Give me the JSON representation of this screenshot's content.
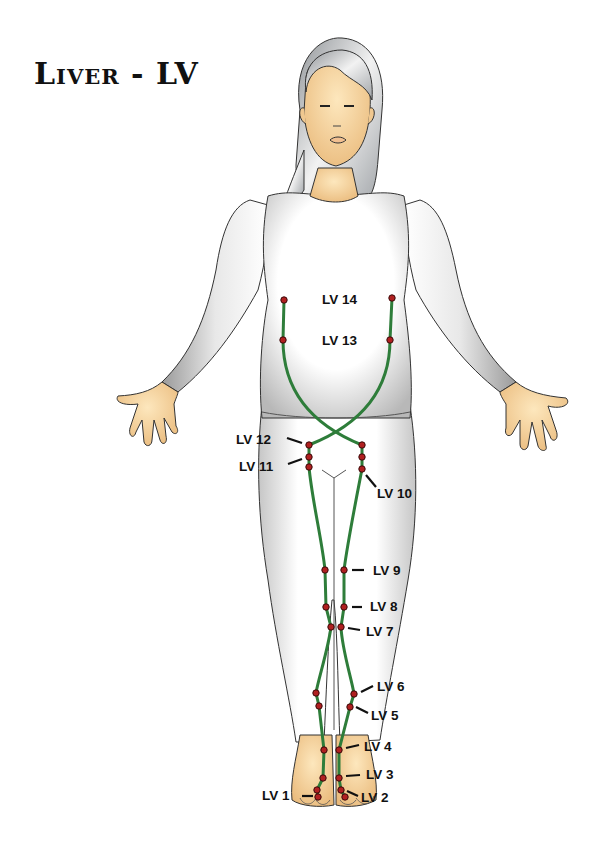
{
  "title": "Liver - LV",
  "colors": {
    "meridian": "#2e7d3a",
    "point_fill": "#b02020",
    "point_stroke": "#3a0a0a",
    "skin": "#f6d9a4",
    "hair": "#b8bcc0",
    "clothing": "#ffffff",
    "outline": "#333333"
  },
  "labels": [
    {
      "id": "lv14",
      "text": "LV 14",
      "x": 322,
      "y": 293
    },
    {
      "id": "lv13",
      "text": "LV 13",
      "x": 322,
      "y": 334
    },
    {
      "id": "lv12",
      "text": "LV 12",
      "x": 236,
      "y": 433
    },
    {
      "id": "lv11",
      "text": "LV 11",
      "x": 239,
      "y": 460
    },
    {
      "id": "lv10",
      "text": "LV 10",
      "x": 377,
      "y": 487
    },
    {
      "id": "lv9",
      "text": "LV 9",
      "x": 373,
      "y": 564
    },
    {
      "id": "lv8",
      "text": "LV 8",
      "x": 370,
      "y": 600
    },
    {
      "id": "lv7",
      "text": "LV 7",
      "x": 366,
      "y": 625
    },
    {
      "id": "lv6",
      "text": "LV 6",
      "x": 377,
      "y": 680
    },
    {
      "id": "lv5",
      "text": "LV 5",
      "x": 371,
      "y": 709
    },
    {
      "id": "lv4",
      "text": "LV 4",
      "x": 364,
      "y": 740
    },
    {
      "id": "lv3",
      "text": "LV 3",
      "x": 366,
      "y": 768
    },
    {
      "id": "lv2",
      "text": "LV 2",
      "x": 361,
      "y": 791
    },
    {
      "id": "lv1",
      "text": "LV 1",
      "x": 262,
      "y": 789
    }
  ],
  "points": [
    {
      "name": "lv14-left",
      "x": 284,
      "y": 300
    },
    {
      "name": "lv14-right",
      "x": 392,
      "y": 298
    },
    {
      "name": "lv13-left",
      "x": 283,
      "y": 340
    },
    {
      "name": "lv13-right",
      "x": 390,
      "y": 340
    },
    {
      "name": "lv12-left",
      "x": 309,
      "y": 445
    },
    {
      "name": "lv12-right",
      "x": 362,
      "y": 445
    },
    {
      "name": "lv11-left",
      "x": 309,
      "y": 457
    },
    {
      "name": "lv11-right",
      "x": 362,
      "y": 457
    },
    {
      "name": "lv10-left",
      "x": 309,
      "y": 467
    },
    {
      "name": "lv10-right",
      "x": 362,
      "y": 469
    },
    {
      "name": "lv9-left",
      "x": 325,
      "y": 570
    },
    {
      "name": "lv9-right",
      "x": 344,
      "y": 570
    },
    {
      "name": "lv8-left",
      "x": 326,
      "y": 607
    },
    {
      "name": "lv8-right",
      "x": 344,
      "y": 607
    },
    {
      "name": "lv7-left",
      "x": 331,
      "y": 627
    },
    {
      "name": "lv7-right",
      "x": 341,
      "y": 627
    },
    {
      "name": "lv6-left",
      "x": 316,
      "y": 693
    },
    {
      "name": "lv6-right",
      "x": 354,
      "y": 694
    },
    {
      "name": "lv5-left",
      "x": 319,
      "y": 706
    },
    {
      "name": "lv5-right",
      "x": 350,
      "y": 707
    },
    {
      "name": "lv4-left",
      "x": 324,
      "y": 750
    },
    {
      "name": "lv4-right",
      "x": 339,
      "y": 750
    },
    {
      "name": "lv3-left",
      "x": 323,
      "y": 778
    },
    {
      "name": "lv3-right",
      "x": 339,
      "y": 778
    },
    {
      "name": "lv2-left",
      "x": 317,
      "y": 790
    },
    {
      "name": "lv2-right",
      "x": 341,
      "y": 790
    },
    {
      "name": "lv1-left",
      "x": 318,
      "y": 797
    },
    {
      "name": "lv1-right",
      "x": 345,
      "y": 797
    }
  ],
  "leaders": [
    {
      "name": "lv12-leader",
      "x1": 287,
      "y1": 438,
      "x2": 302,
      "y2": 443
    },
    {
      "name": "lv11-leader",
      "x1": 288,
      "y1": 464,
      "x2": 302,
      "y2": 459
    },
    {
      "name": "lv10-leader",
      "x1": 366,
      "y1": 475,
      "x2": 376,
      "y2": 487
    },
    {
      "name": "lv9-leader",
      "x1": 352,
      "y1": 570,
      "x2": 364,
      "y2": 570
    },
    {
      "name": "lv8-leader",
      "x1": 352,
      "y1": 607,
      "x2": 362,
      "y2": 607
    },
    {
      "name": "lv7-leader",
      "x1": 348,
      "y1": 628,
      "x2": 360,
      "y2": 630
    },
    {
      "name": "lv6-leader",
      "x1": 361,
      "y1": 692,
      "x2": 373,
      "y2": 686
    },
    {
      "name": "lv5-leader",
      "x1": 356,
      "y1": 707,
      "x2": 368,
      "y2": 713
    },
    {
      "name": "lv4-leader",
      "x1": 346,
      "y1": 748,
      "x2": 359,
      "y2": 745
    },
    {
      "name": "lv3-leader",
      "x1": 346,
      "y1": 776,
      "x2": 360,
      "y2": 775
    },
    {
      "name": "lv2-leader",
      "x1": 347,
      "y1": 791,
      "x2": 358,
      "y2": 796
    },
    {
      "name": "lv1-leader",
      "x1": 302,
      "y1": 796,
      "x2": 313,
      "y2": 796
    }
  ]
}
